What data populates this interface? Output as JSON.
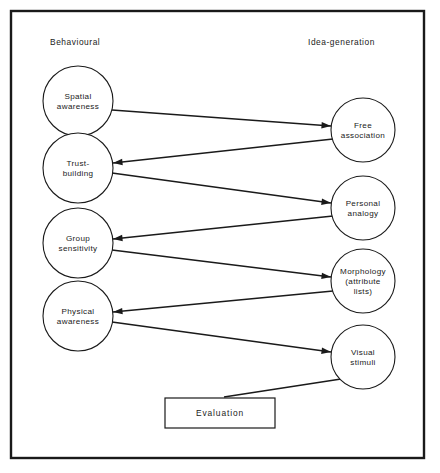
{
  "figure": {
    "frame": {
      "x": 11,
      "y": 11,
      "width": 413,
      "height": 447
    },
    "background_color": "#ffffff",
    "line_color": "#1a1a1a"
  },
  "columns": {
    "left": {
      "label": "Behavioural",
      "x": 50,
      "y": 45
    },
    "right": {
      "label": "Idea-generation",
      "x": 308,
      "y": 45
    }
  },
  "nodes": {
    "left": [
      {
        "id": "spatial-awareness",
        "lines": [
          "Spatial",
          "awareness"
        ],
        "cx": 78,
        "cy": 101,
        "r": 35
      },
      {
        "id": "trust-building",
        "lines": [
          "Trust-",
          "building"
        ],
        "cx": 78,
        "cy": 168,
        "r": 35
      },
      {
        "id": "group-sensitivity",
        "lines": [
          "Group",
          "sensitivity"
        ],
        "cx": 78,
        "cy": 243,
        "r": 35
      },
      {
        "id": "physical-awareness",
        "lines": [
          "Physical",
          "awareness"
        ],
        "cx": 78,
        "cy": 316,
        "r": 35
      }
    ],
    "right": [
      {
        "id": "free-association",
        "lines": [
          "Free",
          "association"
        ],
        "cx": 363,
        "cy": 130,
        "r": 32
      },
      {
        "id": "personal-analogy",
        "lines": [
          "Personal",
          "analogy"
        ],
        "cx": 363,
        "cy": 208,
        "r": 32
      },
      {
        "id": "morphology",
        "lines": [
          "Morphology",
          "(attribute",
          "lists)"
        ],
        "cx": 363,
        "cy": 281,
        "r": 32
      },
      {
        "id": "visual-stimuli",
        "lines": [
          "Visual",
          "stimuli"
        ],
        "cx": 363,
        "cy": 357,
        "r": 32
      }
    ],
    "box": {
      "id": "evaluation",
      "label": "Evaluation",
      "x": 165,
      "y": 398,
      "width": 110,
      "height": 30
    }
  },
  "edges": [
    {
      "id": "spatial-to-free",
      "from": "spatial-awareness",
      "to": "free-association",
      "x1": 112,
      "y1": 110,
      "x2": 331,
      "y2": 126,
      "arrow": "end"
    },
    {
      "id": "free-to-trust",
      "from": "free-association",
      "to": "trust-building",
      "x1": 333,
      "y1": 139,
      "x2": 113,
      "y2": 163,
      "arrow": "end"
    },
    {
      "id": "trust-to-personal",
      "from": "trust-building",
      "to": "personal-analogy",
      "x1": 112,
      "y1": 173,
      "x2": 331,
      "y2": 203,
      "arrow": "end"
    },
    {
      "id": "personal-to-group",
      "from": "personal-analogy",
      "to": "group-sensitivity",
      "x1": 333,
      "y1": 216,
      "x2": 113,
      "y2": 239,
      "arrow": "end"
    },
    {
      "id": "group-to-morphology",
      "from": "group-sensitivity",
      "to": "morphology",
      "x1": 112,
      "y1": 250,
      "x2": 331,
      "y2": 277,
      "arrow": "end"
    },
    {
      "id": "morphology-to-physical",
      "from": "morphology",
      "to": "physical-awareness",
      "x1": 333,
      "y1": 291,
      "x2": 113,
      "y2": 312,
      "arrow": "end"
    },
    {
      "id": "physical-to-visual",
      "from": "physical-awareness",
      "to": "visual-stimuli",
      "x1": 112,
      "y1": 322,
      "x2": 331,
      "y2": 352,
      "arrow": "end"
    },
    {
      "id": "evaluation-to-visual",
      "from": "evaluation",
      "to": "visual-stimuli",
      "x1": 224,
      "y1": 397,
      "x2": 341,
      "y2": 379,
      "arrow": "none"
    }
  ]
}
